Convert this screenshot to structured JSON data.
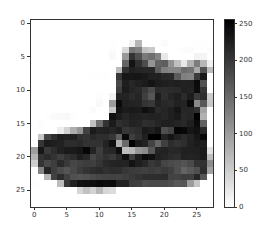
{
  "chart_data": {
    "type": "heatmap",
    "title": "",
    "xlabel": "",
    "ylabel": "",
    "colormap": "gray_r",
    "vmin": 0,
    "vmax": 255,
    "x_ticks": [
      "0",
      "5",
      "10",
      "15",
      "20",
      "25"
    ],
    "y_ticks": [
      "0",
      "5",
      "10",
      "15",
      "20",
      "25"
    ],
    "colorbar_ticks": [
      "0",
      "50",
      "100",
      "150",
      "200",
      "250"
    ],
    "xlim": [
      -0.5,
      27.5
    ],
    "ylim": [
      27.5,
      -0.5
    ],
    "grid": false,
    "colorbar": true,
    "matrix": [
      [
        0,
        0,
        0,
        0,
        0,
        0,
        0,
        0,
        0,
        0,
        0,
        0,
        0,
        0,
        0,
        0,
        0,
        0,
        0,
        0,
        0,
        0,
        0,
        0,
        0,
        0,
        0,
        0
      ],
      [
        0,
        0,
        0,
        0,
        0,
        0,
        0,
        0,
        0,
        0,
        0,
        0,
        0,
        0,
        0,
        0,
        0,
        0,
        0,
        0,
        0,
        0,
        0,
        0,
        0,
        0,
        0,
        0
      ],
      [
        0,
        0,
        0,
        0,
        0,
        0,
        0,
        0,
        0,
        0,
        0,
        0,
        0,
        0,
        0,
        0,
        0,
        0,
        0,
        0,
        0,
        0,
        0,
        0,
        0,
        0,
        0,
        0
      ],
      [
        0,
        0,
        0,
        0,
        0,
        0,
        0,
        0,
        0,
        0,
        0,
        0,
        1,
        0,
        0,
        13,
        73,
        0,
        0,
        1,
        4,
        0,
        0,
        0,
        0,
        1,
        1,
        0
      ],
      [
        0,
        0,
        0,
        0,
        0,
        0,
        0,
        0,
        0,
        0,
        0,
        0,
        3,
        0,
        36,
        136,
        127,
        62,
        54,
        0,
        0,
        0,
        1,
        3,
        4,
        0,
        0,
        3
      ],
      [
        0,
        0,
        0,
        0,
        0,
        0,
        0,
        0,
        0,
        0,
        0,
        0,
        6,
        0,
        102,
        204,
        176,
        134,
        144,
        123,
        23,
        0,
        0,
        0,
        0,
        12,
        10,
        0
      ],
      [
        0,
        0,
        0,
        0,
        0,
        0,
        0,
        0,
        0,
        0,
        0,
        0,
        0,
        0,
        155,
        236,
        207,
        178,
        107,
        156,
        161,
        109,
        64,
        23,
        77,
        130,
        72,
        15
      ],
      [
        0,
        0,
        0,
        0,
        0,
        0,
        0,
        0,
        0,
        0,
        0,
        1,
        0,
        69,
        207,
        223,
        218,
        216,
        216,
        163,
        127,
        121,
        122,
        146,
        141,
        88,
        172,
        66
      ],
      [
        0,
        0,
        0,
        0,
        0,
        0,
        0,
        0,
        0,
        1,
        1,
        1,
        0,
        200,
        232,
        232,
        233,
        229,
        223,
        223,
        215,
        213,
        164,
        127,
        123,
        196,
        229,
        0
      ],
      [
        0,
        0,
        0,
        0,
        0,
        0,
        0,
        0,
        0,
        0,
        0,
        0,
        0,
        183,
        225,
        216,
        223,
        228,
        235,
        227,
        224,
        222,
        224,
        221,
        223,
        245,
        173,
        0
      ],
      [
        0,
        0,
        0,
        0,
        0,
        0,
        0,
        0,
        0,
        0,
        0,
        0,
        0,
        193,
        228,
        218,
        213,
        198,
        180,
        212,
        210,
        211,
        213,
        223,
        220,
        243,
        202,
        0
      ],
      [
        0,
        0,
        0,
        0,
        0,
        0,
        0,
        0,
        0,
        1,
        3,
        0,
        12,
        219,
        220,
        212,
        218,
        192,
        169,
        227,
        208,
        218,
        224,
        212,
        226,
        197,
        209,
        52
      ],
      [
        0,
        0,
        0,
        0,
        0,
        0,
        0,
        0,
        0,
        0,
        6,
        0,
        99,
        244,
        222,
        220,
        218,
        203,
        198,
        221,
        215,
        213,
        222,
        220,
        245,
        119,
        167,
        56
      ],
      [
        0,
        0,
        0,
        0,
        0,
        0,
        0,
        0,
        0,
        4,
        0,
        0,
        55,
        236,
        228,
        230,
        228,
        240,
        232,
        213,
        218,
        223,
        234,
        217,
        217,
        209,
        92,
        0
      ],
      [
        0,
        0,
        1,
        4,
        6,
        7,
        2,
        0,
        0,
        0,
        0,
        0,
        237,
        226,
        217,
        223,
        222,
        219,
        222,
        221,
        216,
        223,
        229,
        215,
        218,
        255,
        77,
        0
      ],
      [
        0,
        3,
        0,
        0,
        0,
        0,
        0,
        0,
        0,
        62,
        145,
        204,
        228,
        207,
        213,
        221,
        218,
        208,
        211,
        218,
        224,
        223,
        219,
        215,
        224,
        244,
        159,
        0
      ],
      [
        0,
        0,
        0,
        0,
        18,
        44,
        82,
        107,
        189,
        228,
        220,
        222,
        217,
        226,
        200,
        205,
        211,
        230,
        224,
        234,
        176,
        188,
        250,
        248,
        233,
        238,
        215,
        0
      ],
      [
        0,
        57,
        187,
        208,
        224,
        221,
        224,
        208,
        204,
        214,
        208,
        209,
        200,
        159,
        245,
        193,
        206,
        223,
        255,
        255,
        221,
        234,
        221,
        211,
        220,
        232,
        246,
        0
      ],
      [
        3,
        202,
        228,
        224,
        221,
        211,
        211,
        214,
        205,
        205,
        205,
        220,
        240,
        80,
        150,
        255,
        229,
        221,
        188,
        154,
        191,
        210,
        204,
        209,
        222,
        228,
        225,
        0
      ],
      [
        98,
        233,
        198,
        210,
        222,
        229,
        229,
        234,
        249,
        220,
        194,
        215,
        217,
        241,
        65,
        73,
        106,
        117,
        168,
        219,
        221,
        215,
        217,
        223,
        223,
        224,
        229,
        29
      ],
      [
        75,
        204,
        212,
        204,
        193,
        205,
        211,
        225,
        216,
        185,
        197,
        206,
        198,
        213,
        240,
        195,
        227,
        245,
        239,
        223,
        218,
        212,
        209,
        222,
        220,
        221,
        230,
        67
      ],
      [
        48,
        203,
        183,
        194,
        213,
        197,
        185,
        190,
        194,
        192,
        202,
        214,
        219,
        221,
        220,
        236,
        225,
        216,
        199,
        206,
        186,
        181,
        177,
        172,
        181,
        205,
        206,
        115
      ],
      [
        0,
        122,
        219,
        193,
        179,
        171,
        183,
        196,
        204,
        210,
        213,
        207,
        211,
        210,
        200,
        196,
        194,
        191,
        195,
        191,
        198,
        192,
        176,
        156,
        167,
        177,
        210,
        92
      ],
      [
        0,
        0,
        74,
        189,
        212,
        191,
        175,
        172,
        175,
        181,
        185,
        188,
        189,
        188,
        193,
        198,
        204,
        209,
        210,
        210,
        211,
        188,
        188,
        194,
        192,
        216,
        170,
        0
      ],
      [
        2,
        0,
        0,
        0,
        66,
        200,
        222,
        237,
        239,
        242,
        246,
        243,
        244,
        221,
        220,
        193,
        191,
        179,
        182,
        182,
        181,
        176,
        166,
        168,
        99,
        58,
        0,
        0
      ],
      [
        0,
        0,
        0,
        0,
        0,
        0,
        0,
        40,
        61,
        44,
        72,
        41,
        35,
        0,
        0,
        0,
        0,
        0,
        0,
        0,
        0,
        0,
        0,
        0,
        0,
        0,
        0,
        0
      ],
      [
        0,
        0,
        0,
        0,
        0,
        0,
        0,
        0,
        0,
        0,
        0,
        0,
        0,
        0,
        0,
        0,
        0,
        0,
        0,
        0,
        0,
        0,
        0,
        0,
        0,
        0,
        0,
        0
      ],
      [
        0,
        0,
        0,
        0,
        0,
        0,
        0,
        0,
        0,
        0,
        0,
        0,
        0,
        0,
        0,
        0,
        0,
        0,
        0,
        0,
        0,
        0,
        0,
        0,
        0,
        0,
        0,
        0
      ]
    ]
  }
}
